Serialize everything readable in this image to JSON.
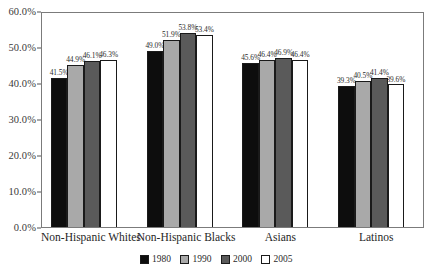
{
  "chart_data": {
    "type": "bar",
    "title": "",
    "subtitle": "",
    "xlabel": "",
    "ylabel": "",
    "categories": [
      "Non-Hispanic Whites",
      "Non-Hispanic Blacks",
      "Asians",
      "Latinos"
    ],
    "series": [
      {
        "name": "1980",
        "color": "#0d0d0d",
        "values": [
          41.5,
          49.0,
          45.6,
          39.3
        ],
        "labels": [
          "41.5%",
          "49.0%",
          "45.6%",
          "39.3%"
        ]
      },
      {
        "name": "1990",
        "color": "#a9a9a9",
        "values": [
          44.9,
          51.9,
          46.4,
          40.5
        ],
        "labels": [
          "44.9%",
          "51.9%",
          "46.4%",
          "40.5%"
        ]
      },
      {
        "name": "2000",
        "color": "#5a5a5a",
        "values": [
          46.1,
          53.8,
          46.9,
          41.4
        ],
        "labels": [
          "46.1%",
          "53.8%",
          "46.9%",
          "41.4%"
        ]
      },
      {
        "name": "2005",
        "color": "#ffffff",
        "values": [
          46.3,
          53.4,
          46.4,
          39.6
        ],
        "labels": [
          "46.3%",
          "53.4%",
          "46.4%",
          "39.6%"
        ]
      }
    ],
    "ylim": [
      0,
      60
    ],
    "ytick_values": [
      0,
      10,
      20,
      30,
      40,
      50,
      60
    ],
    "ytick_labels": [
      "0.0%",
      "10.0%",
      "20.0%",
      "30.0%",
      "40.0%",
      "50.0%",
      "60.0%"
    ],
    "grid": false,
    "legend_position": "bottom",
    "legend_entries": [
      "1980",
      "1990",
      "2000",
      "2005"
    ],
    "plot_border_color": "#7b7b7b",
    "bar_outline_color": "#1a1a1a"
  }
}
